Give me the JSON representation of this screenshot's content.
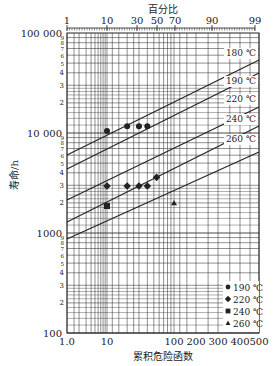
{
  "chart_data": {
    "type": "scatter",
    "title": "",
    "top_axis_title": "百分比",
    "xlabel": "累积危险函数",
    "ylabel": "寿命/h",
    "x_scale": "hazard",
    "y_scale": "log",
    "ylim": [
      100,
      100000
    ],
    "xlim": [
      1,
      500
    ],
    "grid": true,
    "x_ticks": [
      {
        "label": "1.0",
        "value": 1,
        "px": 67
      },
      {
        "label": "10",
        "value": 10,
        "px": 107
      },
      {
        "label": "100",
        "value": 100,
        "px": 174
      },
      {
        "label": "200",
        "value": 200,
        "px": 196
      },
      {
        "label": "300",
        "value": 300,
        "px": 218
      },
      {
        "label": "400",
        "value": 400,
        "px": 240
      },
      {
        "label": "500",
        "value": 500,
        "px": 259
      }
    ],
    "top_ticks": [
      {
        "label": "1",
        "px": 67
      },
      {
        "label": "10",
        "px": 107
      },
      {
        "label": "30",
        "px": 137
      },
      {
        "label": "50",
        "px": 157
      },
      {
        "label": "70",
        "px": 175
      },
      {
        "label": "90",
        "px": 212
      },
      {
        "label": "99",
        "px": 255
      }
    ],
    "y_ticks": [
      {
        "label": "100 000",
        "value": 100000
      },
      {
        "label": "10 000",
        "value": 10000
      },
      {
        "label": "1000",
        "value": 1000
      },
      {
        "label": "100",
        "value": 100
      }
    ],
    "y_minor_labels": [
      "2",
      "3",
      "4",
      "5",
      "6",
      "7",
      "8",
      "9"
    ],
    "series": [
      {
        "name": "190 ℃",
        "marker": "circle",
        "points": [
          [
            10,
            10500
          ],
          [
            20,
            11700
          ],
          [
            30,
            11700
          ],
          [
            40,
            11700
          ]
        ]
      },
      {
        "name": "220 ℃",
        "marker": "diamond",
        "points": [
          [
            10,
            2950
          ],
          [
            20,
            2950
          ],
          [
            30,
            2950
          ],
          [
            40,
            2950
          ],
          [
            55,
            3600
          ]
        ]
      },
      {
        "name": "240 ℃",
        "marker": "square",
        "points": [
          [
            10,
            1860
          ]
        ]
      },
      {
        "name": "260 ℃",
        "marker": "triangle",
        "points": [
          [
            100,
            2000
          ]
        ]
      }
    ],
    "fit_lines": [
      {
        "label": "180 ℃",
        "y_left_px": 155,
        "y_right_px": 60,
        "label_y": 56
      },
      {
        "label": "190 ℃",
        "y_left_px": 169,
        "y_right_px": 73,
        "label_y": 84
      },
      {
        "label": "220 ℃",
        "y_left_px": 200,
        "y_right_px": 107,
        "label_y": 102
      },
      {
        "label": "240 ℃",
        "y_left_px": 222,
        "y_right_px": 126,
        "label_y": 122
      },
      {
        "label": "260 ℃",
        "y_left_px": 239,
        "y_right_px": 152,
        "label_y": 142
      }
    ],
    "legend": {
      "position": "lower right",
      "entries": [
        {
          "marker": "circle",
          "label": "190 ℃"
        },
        {
          "marker": "diamond",
          "label": "220 ℃"
        },
        {
          "marker": "square",
          "label": "240 ℃"
        },
        {
          "marker": "triangle",
          "label": "260 ℃"
        }
      ]
    }
  },
  "colors": {
    "ink": "#222222",
    "grid": "#333333",
    "background": "#ffffff"
  }
}
